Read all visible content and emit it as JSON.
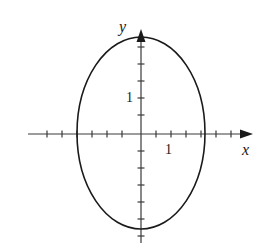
{
  "figure": {
    "width": 271,
    "height": 247,
    "background_color": "#ffffff",
    "stroke_color": "#1a1a1a",
    "axis_color": "#3a3a3a"
  },
  "axes": {
    "origin": {
      "x": 141,
      "y": 134
    },
    "x_axis": {
      "label": "x",
      "label_position": {
        "x": 248,
        "y": 150
      },
      "line_start_x": 28,
      "line_end_x": 252,
      "arrow": "right",
      "unit_px": 15,
      "tick_half_length": 4,
      "tick_label": "1",
      "tick_label_value": 1,
      "tick_label_position": {
        "x": 170,
        "y": 150
      },
      "tick_positions_px": [
        47,
        62,
        77,
        92,
        107,
        122,
        156,
        171,
        186,
        201,
        216,
        231
      ]
    },
    "y_axis": {
      "label": "y",
      "label_position": {
        "x": 128,
        "y": 27
      },
      "line_start_y": 243,
      "line_end_y": 30,
      "arrow": "up",
      "unit_px": 17,
      "tick_half_length": 4,
      "tick_label": "1",
      "tick_label_value": 1,
      "tick_label_position": {
        "x": 133,
        "y": 99
      },
      "tick_positions_px": [
        47,
        64,
        81,
        98,
        115,
        151,
        168,
        185,
        202,
        219,
        236
      ]
    }
  },
  "chart_data": {
    "type": "line",
    "title": "",
    "subtitle": "",
    "xlabel": "x",
    "ylabel": "y",
    "grid": false,
    "legend": "none",
    "curves": [
      {
        "name": "ellipse",
        "shape": "ellipse",
        "center": {
          "x": 0,
          "y": 0
        },
        "semi_axis_x_units": 4.27,
        "semi_axis_y_units": 5.65,
        "semi_axis_x_px": 64,
        "semi_axis_y_px": 96,
        "center_px": {
          "x": 141,
          "y": 133
        },
        "stroke": "#1a1a1a",
        "stroke_width": 1.6,
        "fill": "none",
        "x_intercepts_px": [
          77,
          205
        ],
        "y_intercepts_px": [
          37,
          229
        ]
      }
    ],
    "xlim_px": [
      28,
      252
    ],
    "ylim_px": [
      30,
      243
    ],
    "x_tick_labels": [
      "1"
    ],
    "y_tick_labels": [
      "1"
    ]
  }
}
